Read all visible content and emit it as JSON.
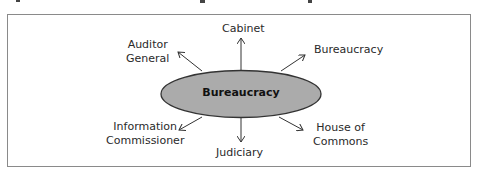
{
  "diagram": {
    "center": {
      "label": "Bureaucracy",
      "fill": "#ababab",
      "stroke": "#333333"
    },
    "nodes": [
      {
        "id": "cabinet",
        "label": "Cabinet"
      },
      {
        "id": "auditor-general",
        "label_line1": "Auditor",
        "label_line2": "General"
      },
      {
        "id": "bureaucracy-right",
        "label": "Bureaucracy"
      },
      {
        "id": "information-commissioner",
        "label_line1": "Information",
        "label_line2": "Commissioner"
      },
      {
        "id": "judiciary",
        "label": "Judiciary"
      },
      {
        "id": "house-of-commons",
        "label_line1": "House of",
        "label_line2": "Commons"
      }
    ],
    "frame_color": "#8a8a8a"
  }
}
